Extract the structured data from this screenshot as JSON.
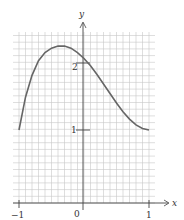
{
  "chart_data": {
    "type": "line",
    "title": "",
    "xlabel": "x",
    "ylabel": "y",
    "xlim": [
      -1,
      1
    ],
    "ylim": [
      0,
      2.5
    ],
    "grid": true,
    "x_ticks": [
      "-1",
      "0",
      "1"
    ],
    "y_ticks": [
      "1",
      "2"
    ],
    "series": [
      {
        "name": "f(x)",
        "x": [
          -1.0,
          -0.9,
          -0.8,
          -0.7,
          -0.6,
          -0.5,
          -0.4,
          -0.3,
          -0.2,
          -0.1,
          0.0,
          0.1,
          0.2,
          0.3,
          0.4,
          0.5,
          0.6,
          0.7,
          0.8,
          0.9,
          1.0
        ],
        "y": [
          1.0,
          1.45,
          1.75,
          1.95,
          2.06,
          2.12,
          2.15,
          2.15,
          2.12,
          2.06,
          1.98,
          1.88,
          1.76,
          1.63,
          1.5,
          1.37,
          1.25,
          1.15,
          1.07,
          1.02,
          1.0
        ]
      }
    ],
    "color": "#555555"
  },
  "labels": {
    "x_axis": "x",
    "y_axis": "y",
    "x_neg1": "−1",
    "x_0": "0",
    "x_1": "1",
    "y_1": "1",
    "y_2": "2"
  }
}
